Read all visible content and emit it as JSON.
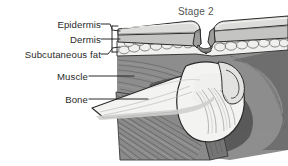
{
  "figure": {
    "title": "Stage 2",
    "kind": "medical-cross-section-illustration",
    "background_color": "#ffffff",
    "line_color": "#2b2b2b",
    "title_color": "#555555"
  },
  "labels": {
    "epidermis": "Epidermis",
    "dermis": "Dermis",
    "subcutaneous_fat": "Subcutaneous fat",
    "muscle": "Muscle",
    "bone": "Bone"
  },
  "anatomy_colors": {
    "epidermis_fill": "#d8d8d8",
    "dermis_fill": "#c0c0c0",
    "fat_fill": "#efefef",
    "muscle_fill": "#8e8e8e",
    "muscle_dark_fill": "#6a6a6a",
    "bone_fill": "#f2f2f0",
    "deep_shadow": "#4a4a4a",
    "outline": "#2b2b2b"
  },
  "leader_lines": [
    {
      "name": "epidermis-leader",
      "from_label": "Epidermis",
      "points_to": "epidermis layer"
    },
    {
      "name": "dermis-leader",
      "from_label": "Dermis",
      "points_to": "dermis layer"
    },
    {
      "name": "subcutaneous-fat-leader",
      "from_label": "Subcutaneous fat",
      "points_to": "subcutaneous fat layer"
    },
    {
      "name": "muscle-leader",
      "from_label": "Muscle",
      "points_to": "muscle tissue"
    },
    {
      "name": "bone-leader",
      "from_label": "Bone",
      "points_to": "bone"
    }
  ]
}
